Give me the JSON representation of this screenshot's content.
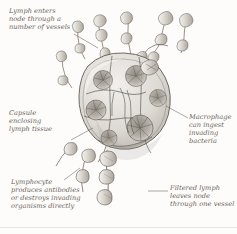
{
  "figure": {
    "style": "pen-and-ink anatomical illustration",
    "background_color": "#fdfcfb",
    "ink_color": "#5f5a54",
    "caption_color": "#6c6257"
  },
  "captions": {
    "afferent": "Lymph enters\nnode through a\nnumber of vessels",
    "capsule": "Capsule\nenclosing\nlymph tissue",
    "macrophage": "Macrophage\ncan ingest\ninvading\nbacteria",
    "lymphocyte": "Lymphocyte\nproduces antibodies\nor destroys invading\norganisms directly",
    "efferent": "Filtered lymph\nleaves node\nthrough one vessel"
  },
  "icons": {
    "lymph_node": "lymph-node-icon",
    "afferent_vessel": "afferent-vessel-icon",
    "efferent_vessel": "efferent-vessel-icon",
    "germinal_center": "germinal-center-icon",
    "leader_line": "leader-line-icon"
  }
}
